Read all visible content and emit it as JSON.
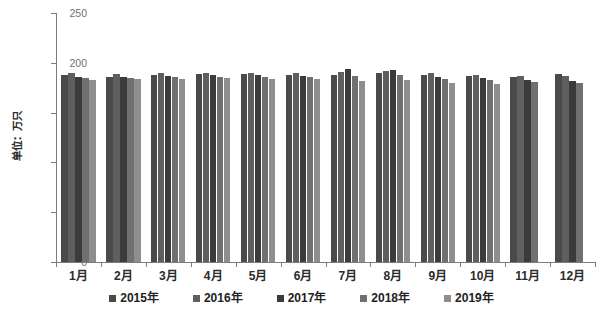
{
  "chart_data": {
    "type": "bar",
    "title": "",
    "xlabel": "",
    "ylabel": "单位：万只",
    "ylim": [
      0,
      250
    ],
    "yticks": [
      0,
      50,
      100,
      150,
      200,
      250
    ],
    "ytick_labels": [
      "0",
      "50",
      "100",
      "150",
      "200",
      "250"
    ],
    "grid": false,
    "legend_position": "bottom",
    "categories": [
      "1月",
      "2月",
      "3月",
      "4月",
      "5月",
      "6月",
      "7月",
      "8月",
      "9月",
      "10月",
      "11月",
      "12月"
    ],
    "series": [
      {
        "name": "2015年",
        "color": "#4a4a4a",
        "values": [
          188,
          186,
          188,
          189,
          189,
          188,
          188,
          190,
          188,
          187,
          186,
          189
        ]
      },
      {
        "name": "2016年",
        "color": "#5f5f5f",
        "values": [
          190,
          189,
          190,
          190,
          190,
          190,
          191,
          192,
          190,
          188,
          187,
          187
        ]
      },
      {
        "name": "2017年",
        "color": "#3b3b3b",
        "values": [
          186,
          186,
          187,
          188,
          188,
          187,
          194,
          193,
          186,
          185,
          183,
          182
        ]
      },
      {
        "name": "2018年",
        "color": "#707070",
        "values": [
          185,
          185,
          186,
          186,
          186,
          186,
          187,
          188,
          184,
          183,
          181,
          180
        ]
      },
      {
        "name": "2019年",
        "color": "#8e8e8e",
        "values": [
          183,
          184,
          184,
          185,
          184,
          184,
          182,
          183,
          180,
          179,
          null,
          null
        ]
      }
    ]
  },
  "axes": {
    "y_axis_title": "单位：万只",
    "tick_color": "#7d7d7d",
    "label_color": "#6f6f6f"
  },
  "legend": {
    "items": [
      {
        "label": "2015年",
        "color": "#4a4a4a"
      },
      {
        "label": "2016年",
        "color": "#5f5f5f"
      },
      {
        "label": "2017年",
        "color": "#3b3b3b"
      },
      {
        "label": "2018年",
        "color": "#707070"
      },
      {
        "label": "2019年",
        "color": "#8e8e8e"
      }
    ]
  }
}
